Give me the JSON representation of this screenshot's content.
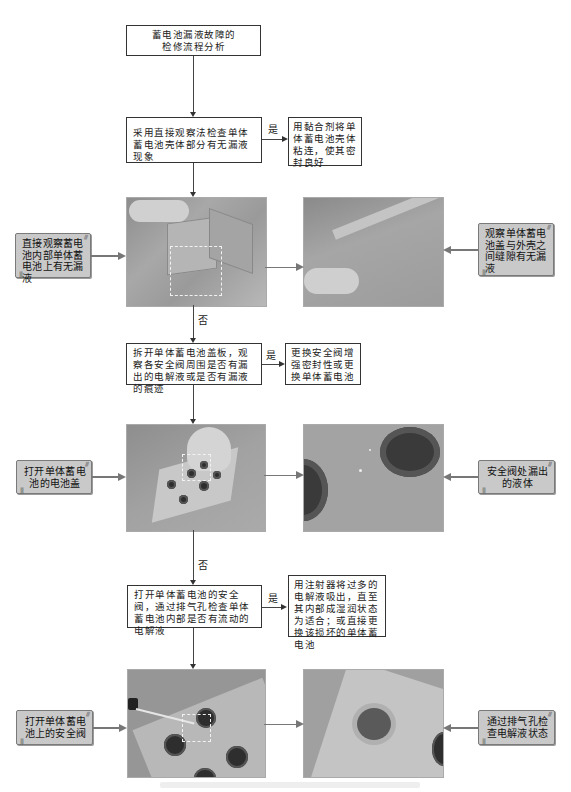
{
  "flow": {
    "start": {
      "line1": "蓄电池漏液故障的",
      "line2": "检修流程分析"
    },
    "steps": [
      {
        "check": "采用直接观察法检查单体蓄电池壳体部分有无漏液现象",
        "yes_label": "是",
        "yes_action": "用黏合剂将单体蓄电池壳体粘连，使其密封良好",
        "no_label": "否",
        "left_note": "直接观察蓄电池内部单体蓄电池上有无漏液",
        "right_note": "观察单体蓄电池盖与外壳之间缝隙有无漏液",
        "photo_left": "battery-cell-hand-inspection-photo",
        "photo_right": "battery-lid-seam-closeup-photo"
      },
      {
        "check": "拆开单体蓄电池盖板，观察各安全阀周围是否有漏出的电解液或是否有漏液的痕迹",
        "yes_label": "是",
        "yes_action": "更换安全阀增强密封性或更换单体蓄电池",
        "no_label": "否",
        "left_note": "打开单体蓄电池的电池盖",
        "right_note": "安全阀处漏出的液体",
        "photo_left": "battery-cover-open-photo",
        "photo_right": "safety-valve-leak-closeup-photo"
      },
      {
        "check": "打开单体蓄电池的安全阀，通过排气孔检查单体蓄电池内部是否有流动的电解液",
        "yes_label": "是",
        "yes_action": "用注射器将过多的电解液吸出，直至其内部成湿润状态为适合；或直接更换该损坏的单体蓄电池",
        "left_note": "打开单体蓄电池上的安全阀",
        "right_note": "通过排气孔检查电解液状态",
        "photo_left": "screwdriver-opening-valve-photo",
        "photo_right": "vent-hole-closeup-photo"
      }
    ]
  },
  "colors": {
    "line": "#444444",
    "note_fill": "#c9c9c9",
    "note_border": "#7a7a7a",
    "connector_grey": "#777777",
    "photo_dash": "#f2f2f2"
  }
}
